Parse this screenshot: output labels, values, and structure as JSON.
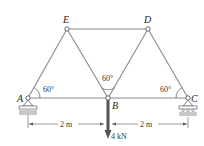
{
  "diagram": {
    "type": "truss",
    "joints": {
      "A": {
        "label": "A",
        "x": 28,
        "y": 98
      },
      "B": {
        "label": "B",
        "x": 108,
        "y": 98
      },
      "C": {
        "label": "C",
        "x": 188,
        "y": 98
      },
      "D": {
        "label": "D",
        "x": 148,
        "y": 29
      },
      "E": {
        "label": "E",
        "x": 67,
        "y": 29
      }
    },
    "members": [
      "AE",
      "EB",
      "BD",
      "DC",
      "ED",
      "AB",
      "BC"
    ],
    "angles": {
      "at_A": "60°",
      "at_B": "60°",
      "at_C": "60°"
    },
    "dimensions": {
      "left": "2 m",
      "right": "2 m"
    },
    "load": {
      "label": "4 kN",
      "joint": "B",
      "direction": "down"
    },
    "supports": {
      "A": "pin",
      "C": "roller"
    }
  }
}
